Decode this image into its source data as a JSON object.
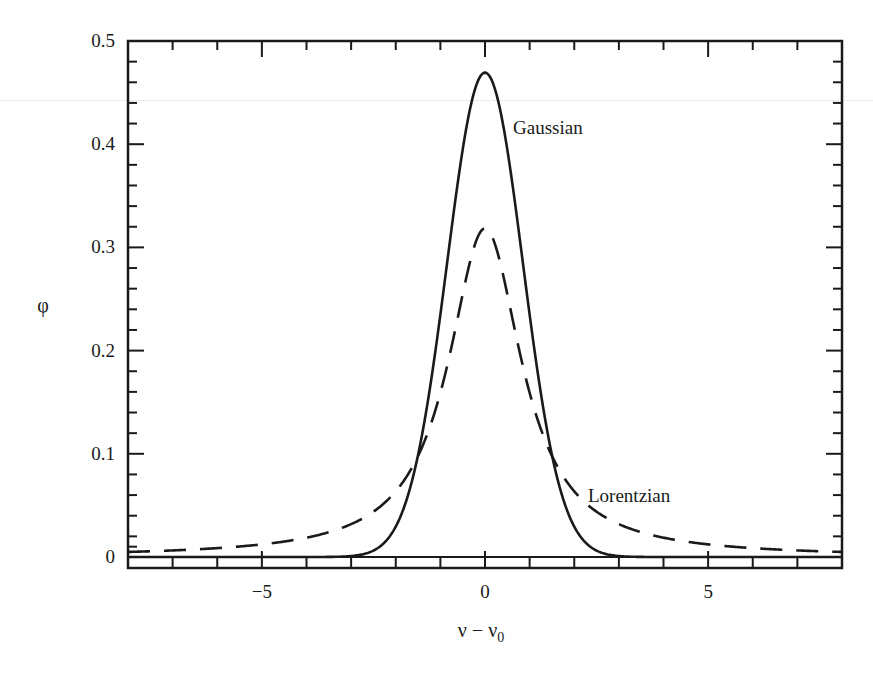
{
  "chart_data": {
    "type": "line",
    "title": "",
    "xlabel": "ν − ν0",
    "xlabel_main": "ν − ν",
    "xlabel_sub": "0",
    "ylabel": "φ",
    "xlim": [
      -8,
      8
    ],
    "ylim": [
      0,
      0.5
    ],
    "grid": false,
    "legend": "inline annotations",
    "x_ticks": [
      {
        "value": -5,
        "label": "−5"
      },
      {
        "value": 0,
        "label": "0"
      },
      {
        "value": 5,
        "label": "5"
      }
    ],
    "y_ticks": [
      {
        "value": 0,
        "label": "0"
      },
      {
        "value": 0.1,
        "label": "0.1"
      },
      {
        "value": 0.2,
        "label": "0.2"
      },
      {
        "value": 0.3,
        "label": "0.3"
      },
      {
        "value": 0.4,
        "label": "0.4"
      },
      {
        "value": 0.5,
        "label": "0.5"
      }
    ],
    "series": [
      {
        "name": "Gaussian",
        "style": "solid",
        "function": "gaussian",
        "sigma": 0.85,
        "peak": 0.469,
        "x": [
          -8,
          -4,
          -3,
          -2.5,
          -2,
          -1.5,
          -1,
          -0.5,
          0,
          0.5,
          1,
          1.5,
          2,
          2.5,
          3,
          4,
          8
        ],
        "values": [
          0.0,
          0.0002,
          0.001,
          0.0063,
          0.0294,
          0.0989,
          0.234,
          0.395,
          0.469,
          0.395,
          0.234,
          0.0989,
          0.0294,
          0.0063,
          0.001,
          0.0002,
          0.0
        ]
      },
      {
        "name": "Lorentzian",
        "style": "dashed",
        "function": "lorentzian",
        "gamma": 1.0,
        "peak": 0.318,
        "x": [
          -8,
          -6,
          -4,
          -3,
          -2,
          -1.5,
          -1,
          -0.5,
          0,
          0.5,
          1,
          1.5,
          2,
          3,
          4,
          6,
          8
        ],
        "values": [
          0.0049,
          0.0086,
          0.0187,
          0.0318,
          0.0637,
          0.0979,
          0.159,
          0.255,
          0.318,
          0.255,
          0.159,
          0.0979,
          0.0637,
          0.0318,
          0.0187,
          0.0086,
          0.0049
        ]
      }
    ],
    "annotations": [
      {
        "text": "Gaussian",
        "x": 0.7,
        "y": 0.43
      },
      {
        "text": "Lorentzian",
        "x": 2.4,
        "y": 0.06
      }
    ]
  },
  "plot": {
    "left": 128,
    "right": 842,
    "top": 41,
    "bottom": 568,
    "zero_y": 557,
    "line_color": "#1a1a1a"
  }
}
